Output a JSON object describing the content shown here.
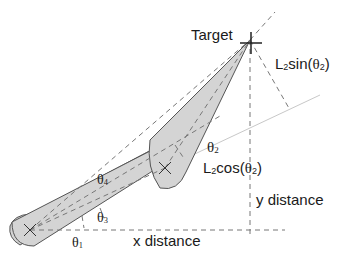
{
  "labels": {
    "target": "Target",
    "l2sin": {
      "pre": "L",
      "sub": "2",
      "mid": "sin(",
      "theta": "θ",
      "tsub": "2",
      "post": ")"
    },
    "l2cos": {
      "pre": "L",
      "sub": "2",
      "mid": "cos(",
      "theta": "θ",
      "tsub": "2",
      "post": ")"
    },
    "theta2": {
      "theta": "θ",
      "sub": "2"
    },
    "theta4": {
      "theta": "θ",
      "sub": "4"
    },
    "theta3": {
      "theta": "θ",
      "sub": "3"
    },
    "theta1": {
      "theta": "θ",
      "sub": "1"
    },
    "y_distance": "y distance",
    "x_distance": "x distance"
  },
  "colors": {
    "link_fill": "#d4d4d4",
    "link_stroke": "#555555",
    "dash": "#777777",
    "light_line": "#bbbbbb",
    "text": "#1a1a1a"
  }
}
